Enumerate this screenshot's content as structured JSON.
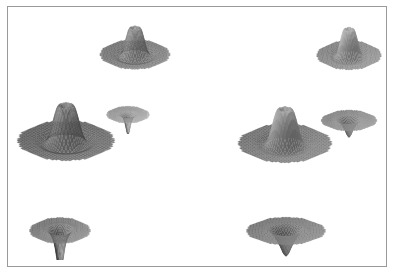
{
  "figure": {
    "title": "",
    "background_color": "#ffffff",
    "frame_color": "#9a9a9a",
    "frame": {
      "x": 7,
      "y": 6,
      "width": 380,
      "height": 261
    },
    "canvas": {
      "width": 394,
      "height": 274
    }
  },
  "chart_data": {
    "type": "surface-grid",
    "title": "",
    "subtitle": "",
    "xlabel": "",
    "ylabel": "",
    "legend": [],
    "annotations": [],
    "grid": false,
    "colormap": "grayscale",
    "panel_count": 8,
    "clusters": [
      {
        "name": "left-cluster",
        "render_style": "wireframe-mesh"
      },
      {
        "name": "right-cluster",
        "render_style": "smooth-shaded"
      }
    ],
    "panels": [
      {
        "id": "left-top-peak",
        "name": "surface-plot-left-top",
        "cluster": "left-cluster",
        "style": "mesh",
        "orientation": "upright",
        "shape": "four-pointed-peak",
        "x": 96,
        "y": 8,
        "width": 78,
        "height": 80,
        "tone_light": "#bdbdbd",
        "tone_dark": "#4a4a4a",
        "mesh_lines": 22,
        "peak_height": 1.0,
        "spike_depth": 0.55
      },
      {
        "id": "left-mid-small-faint",
        "name": "surface-plot-left-small",
        "cluster": "left-cluster",
        "style": "mesh",
        "orientation": "inverted",
        "shape": "shallow-bowl-with-spike",
        "x": 104,
        "y": 88,
        "width": 48,
        "height": 46,
        "tone_light": "#f2f2f2",
        "tone_dark": "#5a5a5a",
        "mesh_lines": 18,
        "peak_height": 0.22,
        "spike_depth": 0.8
      },
      {
        "id": "left-large-peak",
        "name": "surface-plot-left-large",
        "cluster": "left-cluster",
        "style": "mesh",
        "orientation": "upright",
        "shape": "four-pointed-peak",
        "x": 12,
        "y": 78,
        "width": 108,
        "height": 108,
        "tone_light": "#b0b0b0",
        "tone_dark": "#3c3c3c",
        "mesh_lines": 30,
        "peak_height": 1.0,
        "spike_depth": 0.62
      },
      {
        "id": "left-bottom-bowl",
        "name": "surface-plot-left-bottom",
        "cluster": "left-cluster",
        "style": "mesh",
        "orientation": "inverted",
        "shape": "fan-bowl-with-spike",
        "x": 26,
        "y": 190,
        "width": 68,
        "height": 70,
        "tone_light": "#d8d8d8",
        "tone_dark": "#3a3a3a",
        "mesh_lines": 24,
        "peak_height": 0.45,
        "spike_depth": 1.0
      },
      {
        "id": "right-top-peak",
        "name": "surface-plot-right-top",
        "cluster": "right-cluster",
        "style": "shaded",
        "orientation": "upright",
        "shape": "four-pointed-peak",
        "x": 313,
        "y": 10,
        "width": 72,
        "height": 78,
        "tone_light": "#c2c2c2",
        "tone_dark": "#4e4e4e",
        "mesh_lines": 0,
        "peak_height": 1.0,
        "spike_depth": 0.52
      },
      {
        "id": "right-mid-bowl",
        "name": "surface-plot-right-small-bowl",
        "cluster": "right-cluster",
        "style": "shaded",
        "orientation": "inverted",
        "shape": "rounded-bowl",
        "x": 318,
        "y": 88,
        "width": 62,
        "height": 56,
        "tone_light": "#c8c8c8",
        "tone_dark": "#4a4a4a",
        "mesh_lines": 0,
        "peak_height": 0.4,
        "spike_depth": 0.3
      },
      {
        "id": "right-large-peak",
        "name": "surface-plot-right-large",
        "cluster": "right-cluster",
        "style": "shaded",
        "orientation": "upright",
        "shape": "four-pointed-peak",
        "x": 233,
        "y": 83,
        "width": 104,
        "height": 104,
        "tone_light": "#b8b8b8",
        "tone_dark": "#3f3f3f",
        "mesh_lines": 0,
        "peak_height": 1.0,
        "spike_depth": 0.6
      },
      {
        "id": "right-bottom-bowl",
        "name": "surface-plot-right-bottom",
        "cluster": "right-cluster",
        "style": "shaded",
        "orientation": "inverted",
        "shape": "rounded-bowl",
        "x": 242,
        "y": 188,
        "width": 88,
        "height": 74,
        "tone_light": "#bfbfbf",
        "tone_dark": "#3d3d3d",
        "mesh_lines": 0,
        "peak_height": 0.52,
        "spike_depth": 0.28
      }
    ]
  }
}
